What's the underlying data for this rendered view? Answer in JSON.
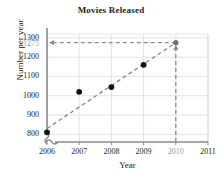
{
  "chart_data": {
    "type": "scatter",
    "title": "Movies Released",
    "xlabel": "Year",
    "ylabel": "Number per year",
    "x": [
      2006,
      2007,
      2008,
      2009
    ],
    "values": [
      810,
      1020,
      1045,
      1160
    ],
    "series": [
      {
        "name": "Movies released per year",
        "points": [
          {
            "x": 2006,
            "y": 810
          },
          {
            "x": 2007,
            "y": 1020
          },
          {
            "x": 2008,
            "y": 1045
          },
          {
            "x": 2009,
            "y": 1160
          }
        ]
      }
    ],
    "trend_line": {
      "name": "line of best fit",
      "style": "dashed",
      "color": "#8c8c8c",
      "x_start": 2006,
      "y_start": 830,
      "x_end": 2010,
      "y_end": 1275
    },
    "projection": {
      "x": 2010,
      "y": 1275,
      "label": "1275",
      "vertical_guide": true,
      "horizontal_guide": true,
      "color": "#8c8c8c"
    },
    "xlim": [
      2006,
      2011
    ],
    "ylim": [
      760,
      1320
    ],
    "xticks": [
      "2006",
      "2007",
      "2008",
      "2009",
      "2010",
      "2011"
    ],
    "xticks_values": [
      2006,
      2007,
      2008,
      2009,
      2010,
      2011
    ],
    "xticks_muted": [
      false,
      false,
      false,
      false,
      true,
      false
    ],
    "yticks": [
      "800",
      "900",
      "1000",
      "1100",
      "1200",
      "1300"
    ],
    "yticks_values": [
      800,
      900,
      1000,
      1100,
      1200,
      1300
    ],
    "extra_ytick": {
      "label": "1275",
      "value": 1275,
      "muted": true
    },
    "grid": true,
    "axis_break_x": true,
    "axis_break_y": true,
    "legend": null,
    "point_color": "#111111",
    "grid_color": "#e2e2e2",
    "axis_color": "#8a8a8a"
  }
}
